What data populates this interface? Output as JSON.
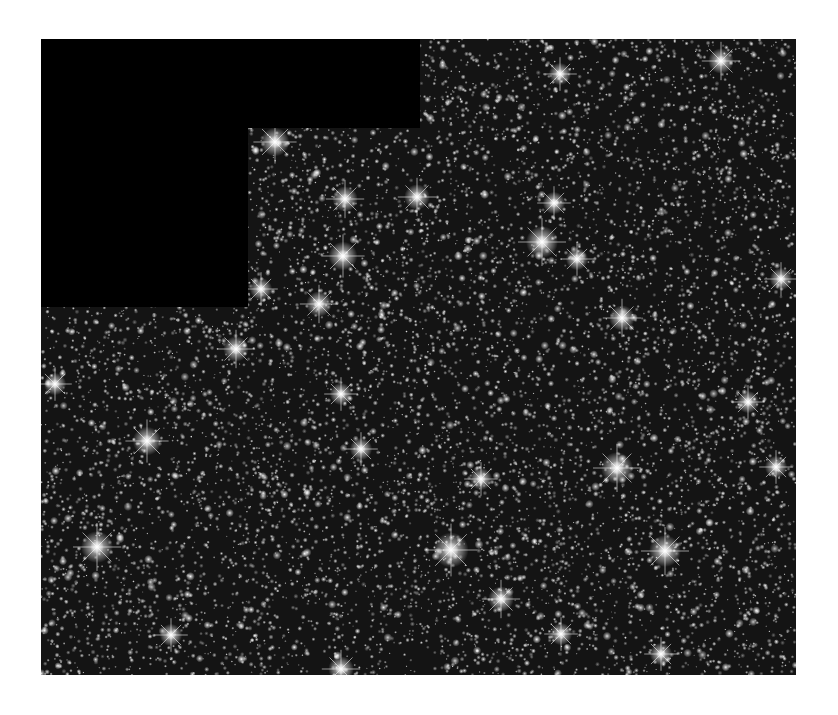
{
  "image": {
    "subject": "dense star field (globular cluster)",
    "colormap": "grayscale",
    "background_color": "#ffffff",
    "frame": {
      "x": 41,
      "y": 39,
      "width": 755,
      "height": 636,
      "base_color": "#1a1a1a"
    },
    "masked_regions": [
      {
        "name": "mask-top",
        "x": 0,
        "y": 0,
        "width": 379,
        "height": 89,
        "color": "#000000"
      },
      {
        "name": "mask-left",
        "x": 0,
        "y": 89,
        "width": 207,
        "height": 179,
        "color": "#000000"
      }
    ],
    "field": {
      "faint_star_count": 9000,
      "medium_star_count": 900,
      "bright_stars": [
        [
          234,
          103,
          9
        ],
        [
          304,
          160,
          8
        ],
        [
          376,
          158,
          8
        ],
        [
          501,
          203,
          10
        ],
        [
          513,
          164,
          7
        ],
        [
          536,
          220,
          7
        ],
        [
          581,
          279,
          8
        ],
        [
          302,
          217,
          9
        ],
        [
          278,
          265,
          8
        ],
        [
          220,
          250,
          7
        ],
        [
          106,
          402,
          9
        ],
        [
          56,
          508,
          10
        ],
        [
          300,
          355,
          7
        ],
        [
          410,
          511,
          11
        ],
        [
          576,
          429,
          10
        ],
        [
          624,
          512,
          10
        ],
        [
          707,
          363,
          7
        ],
        [
          735,
          428,
          7
        ],
        [
          460,
          560,
          8
        ],
        [
          300,
          630,
          8
        ],
        [
          195,
          310,
          8
        ],
        [
          14,
          345,
          7
        ],
        [
          680,
          22,
          8
        ],
        [
          519,
          35,
          7
        ],
        [
          740,
          240,
          7
        ],
        [
          520,
          595,
          7
        ],
        [
          130,
          596,
          7
        ],
        [
          620,
          615,
          7
        ],
        [
          440,
          440,
          7
        ],
        [
          320,
          410,
          7
        ]
      ]
    }
  }
}
